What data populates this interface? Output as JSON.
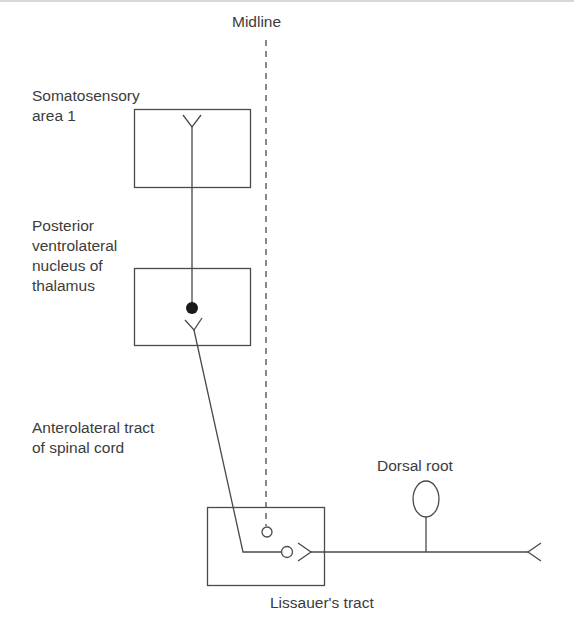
{
  "diagram": {
    "type": "neural-pathway",
    "labels": {
      "midline": "Midline",
      "somatosensory_line1": "Somatosensory",
      "somatosensory_line2": "area 1",
      "pvl_line1": "Posterior",
      "pvl_line2": "ventrolateral",
      "pvl_line3": "nucleus of",
      "pvl_line4": "thalamus",
      "anterolateral_line1": "Anterolateral tract",
      "anterolateral_line2": "of spinal cord",
      "dorsal_root": "Dorsal root",
      "lissauer": "Lissauer's tract"
    },
    "colors": {
      "stroke": "#4a4a4a",
      "text": "#3c3c3c",
      "fill_dot": "#1a1a1a",
      "background": "#ffffff"
    }
  }
}
